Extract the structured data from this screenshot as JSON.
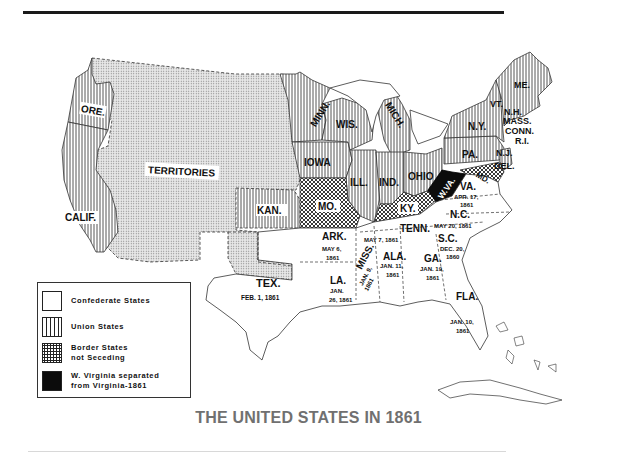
{
  "title": "THE UNITED STATES IN 1861",
  "legend": {
    "items": [
      {
        "key": "confederate",
        "label": "Confederate States",
        "pattern": "blank"
      },
      {
        "key": "union",
        "label": "Union States",
        "pattern": "vertical-lines"
      },
      {
        "key": "border",
        "label_line1": "Border States",
        "label_line2": "not Seceding",
        "pattern": "crosshatch"
      },
      {
        "key": "wv",
        "label_line1": "W. Virginia separated",
        "label_line2": "from Virginia-1861",
        "pattern": "solid-black"
      }
    ]
  },
  "regions": {
    "territories": {
      "label": "TERRITORIES",
      "category": "territory"
    },
    "ore": {
      "label": "ORE.",
      "category": "union"
    },
    "calif": {
      "label": "CALIF.",
      "category": "union"
    },
    "kan": {
      "label": "KAN.",
      "category": "union"
    },
    "minn": {
      "label": "MINN.",
      "category": "union"
    },
    "iowa": {
      "label": "IOWA",
      "category": "union"
    },
    "wis": {
      "label": "WIS.",
      "category": "union"
    },
    "mich": {
      "label": "MICH.",
      "category": "union"
    },
    "ill": {
      "label": "ILL.",
      "category": "union"
    },
    "ind": {
      "label": "IND.",
      "category": "union"
    },
    "ohio": {
      "label": "OHIO",
      "category": "union"
    },
    "pa": {
      "label": "PA.",
      "category": "union"
    },
    "ny": {
      "label": "N.Y.",
      "category": "union"
    },
    "vt": {
      "label": "VT.",
      "category": "union"
    },
    "nh": {
      "label": "N.H.",
      "category": "union"
    },
    "me": {
      "label": "ME.",
      "category": "union"
    },
    "mass": {
      "label": "MASS.",
      "category": "union"
    },
    "conn": {
      "label": "CONN.",
      "category": "union"
    },
    "ri": {
      "label": "R.I.",
      "category": "union"
    },
    "nj": {
      "label": "N.J.",
      "category": "union"
    },
    "mo": {
      "label": "MO.",
      "category": "border"
    },
    "ky": {
      "label": "KY.",
      "category": "border"
    },
    "md": {
      "label": "MD.",
      "category": "border"
    },
    "del": {
      "label": "DEL.",
      "category": "border"
    },
    "wv": {
      "label": "W.VA.",
      "category": "wv"
    },
    "va": {
      "label": "VA.",
      "date1": "APR. 17,",
      "date2": "1861",
      "category": "confederate"
    },
    "nc": {
      "label": "N.C.",
      "date1": "MAY 20, 1861",
      "category": "confederate"
    },
    "tenn": {
      "label": "TENN.",
      "date1": "MAY 7, 1861",
      "category": "confederate"
    },
    "sc": {
      "label": "S.C.",
      "date1": "DEC. 20,",
      "date2": "1860",
      "category": "confederate"
    },
    "ark": {
      "label": "ARK.",
      "date1": "MAY 6,",
      "date2": "1861",
      "category": "confederate"
    },
    "miss": {
      "label": "MISS.",
      "date1": "JAN. 9,",
      "date2": "1861",
      "category": "confederate"
    },
    "ala": {
      "label": "ALA.",
      "date1": "JAN. 11,",
      "date2": "1861",
      "category": "confederate"
    },
    "ga": {
      "label": "GA.",
      "date1": "JAN. 19,",
      "date2": "1861",
      "category": "confederate"
    },
    "la": {
      "label": "LA.",
      "date1": "JAN.",
      "date2": "26, 1861",
      "category": "confederate"
    },
    "tex": {
      "label": "TEX.",
      "date1": "FEB. 1, 1861",
      "category": "confederate"
    },
    "fla": {
      "label": "FLA.",
      "date1": "JAN. 10,",
      "date2": "1861",
      "category": "confederate"
    }
  }
}
